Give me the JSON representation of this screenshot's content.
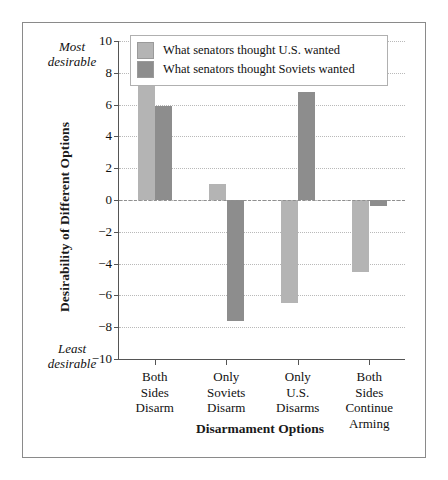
{
  "annotations": {
    "most_desirable": "Most\ndesirable",
    "least_desirable": "Least\ndesirable"
  },
  "chart_data": {
    "type": "bar",
    "title": "",
    "xlabel": "Disarmament Options",
    "ylabel": "Desirability of Different Options",
    "categories": [
      "Both\nSides\nDisarm",
      "Only\nSoviets\nDisarm",
      "Only\nU.S.\nDisarms",
      "Both\nSides\nContinue\nArming"
    ],
    "series": [
      {
        "name": "What senators thought U.S. wanted",
        "color": "#b4b4b4",
        "values": [
          7.8,
          1.0,
          -6.5,
          -4.5
        ]
      },
      {
        "name": "What senators thought Soviets wanted",
        "color": "#8d8d8d",
        "values": [
          5.9,
          -7.6,
          6.8,
          -0.4
        ]
      }
    ],
    "ylim": [
      -10,
      10
    ],
    "yticks": [
      10,
      8,
      6,
      4,
      2,
      0,
      -2,
      -4,
      -6,
      -8,
      -10
    ],
    "ytick_labels": [
      "10",
      "8",
      "6",
      "4",
      "2",
      "0",
      "−2",
      "−4",
      "−6",
      "−8",
      "−10"
    ],
    "grid": true,
    "gridline_style": "dotted",
    "zero_line": true,
    "zero_line_style": "dashed",
    "legend_position": "top-left-inside"
  }
}
